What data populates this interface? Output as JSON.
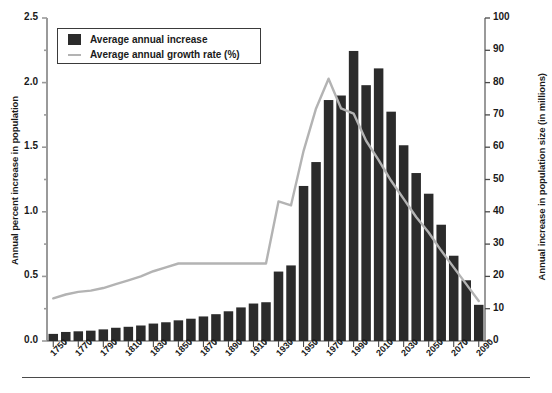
{
  "chart_data": {
    "type": "bar",
    "title": "",
    "xlabel": "",
    "ylabel": "Annual percent increase in population",
    "y2label": "Annual increase in population size (in millions)",
    "ylim": [
      0,
      2.5
    ],
    "y2lim": [
      0,
      100
    ],
    "yticks": [
      "0.0",
      "0.5",
      "1.0",
      "1.5",
      "2.0",
      "2.5"
    ],
    "ytick_values": [
      0.0,
      0.5,
      1.0,
      1.5,
      2.0,
      2.5
    ],
    "y2ticks": [
      "0",
      "10",
      "20",
      "30",
      "40",
      "50",
      "60",
      "70",
      "80",
      "90",
      "100"
    ],
    "y2tick_values": [
      0,
      10,
      20,
      30,
      40,
      50,
      60,
      70,
      80,
      90,
      100
    ],
    "xtick_labels": [
      "1750",
      "1770",
      "1790",
      "1810",
      "1830",
      "1850",
      "1870",
      "1890",
      "1910",
      "1930",
      "1950",
      "1970",
      "1990",
      "2010",
      "2030",
      "2050",
      "2070",
      "2090"
    ],
    "xlim": [
      1750,
      2100
    ],
    "grid": false,
    "legend_position": "upper left",
    "categories": [
      1750,
      1760,
      1770,
      1780,
      1790,
      1800,
      1810,
      1820,
      1830,
      1840,
      1850,
      1860,
      1870,
      1880,
      1890,
      1900,
      1910,
      1920,
      1930,
      1940,
      1950,
      1960,
      1970,
      1980,
      1990,
      2000,
      2010,
      2020,
      2030,
      2040,
      2050,
      2060,
      2070,
      2080,
      2090
    ],
    "series": [
      {
        "name": "Average annual increase",
        "type": "bar",
        "axis": "right",
        "unit": "millions",
        "color": "#2b2b2b",
        "values": [
          2.2,
          2.8,
          3.0,
          3.2,
          3.6,
          4.1,
          4.4,
          4.8,
          5.4,
          5.8,
          6.4,
          6.9,
          7.6,
          8.3,
          9.2,
          10.4,
          11.6,
          12.0,
          21.5,
          23.4,
          48.0,
          55.4,
          74.6,
          76.0,
          89.8,
          79.2,
          84.4,
          71.0,
          60.6,
          52.0,
          45.6,
          36.0,
          26.4,
          18.8,
          11.2
        ]
      },
      {
        "name": "Average annual growth rate (%)",
        "type": "line",
        "axis": "left",
        "unit": "percent",
        "color": "#b3b3b3",
        "values": [
          0.33,
          0.36,
          0.38,
          0.39,
          0.41,
          0.44,
          0.47,
          0.5,
          0.54,
          0.57,
          0.6,
          0.6,
          0.6,
          0.6,
          0.6,
          0.6,
          0.6,
          0.6,
          1.08,
          1.05,
          1.47,
          1.8,
          2.03,
          1.8,
          1.76,
          1.55,
          1.4,
          1.24,
          1.1,
          0.96,
          0.84,
          0.7,
          0.57,
          0.44,
          0.31
        ]
      }
    ]
  },
  "legend": {
    "items": [
      {
        "label": "Average annual increase",
        "marker": "square",
        "color": "#2b2b2b"
      },
      {
        "label": "Average annual growth rate (%)",
        "marker": "line",
        "color": "#b3b3b3"
      }
    ]
  }
}
